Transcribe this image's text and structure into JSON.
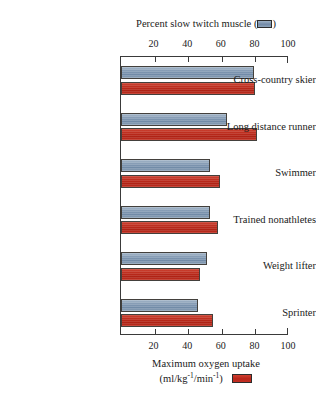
{
  "chart_data": {
    "type": "bar",
    "orientation": "horizontal",
    "title": "Percent slow twitch muscle (",
    "title_suffix": ")",
    "top_axis_label": "Percent slow twitch muscle",
    "bottom_axis_label_line1": "Maximum oxygen uptake",
    "bottom_axis_label_line2_pre": "(ml/kg",
    "bottom_axis_label_line2_sup1": "-1",
    "bottom_axis_label_line2_mid": "/min",
    "bottom_axis_label_line2_sup2": "-1",
    "bottom_axis_label_line2_post": ")",
    "categories": [
      "Cross-country skier",
      "Long distance runner",
      "Swimmer",
      "Trained nonathletes",
      "Weight lifter",
      "Sprinter"
    ],
    "series": [
      {
        "name": "Percent slow twitch muscle",
        "color": "#7289a6",
        "values": [
          79,
          63,
          53,
          53,
          51,
          46
        ]
      },
      {
        "name": "Maximum oxygen uptake",
        "color": "#b9251a",
        "values": [
          80,
          81,
          59,
          58,
          47,
          55
        ]
      }
    ],
    "xlim": [
      0,
      100
    ],
    "ticks": [
      20,
      40,
      60,
      80,
      100
    ],
    "tick_labels": [
      "20",
      "40",
      "60",
      "80",
      "100"
    ],
    "grid": false,
    "legend_position": "axis-labels",
    "colors": {
      "blue": "#7289a6",
      "red": "#b9251a",
      "axis": "#3a3a3a",
      "text": "#1a1a1a",
      "background": "#ffffff"
    }
  }
}
